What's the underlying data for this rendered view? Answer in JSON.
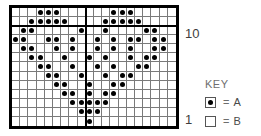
{
  "chart_data": {
    "type": "heatmap",
    "title": "",
    "subtitle": "",
    "xlabel": "",
    "ylabel": "",
    "grid": true,
    "legend_position": "right",
    "columns": 20,
    "rows": 13,
    "symbols": {
      "A": "filled-dot",
      "B": "empty"
    },
    "row_labels": {
      "top": "10",
      "bottom": "1"
    },
    "heavy_column_divider_after": 9,
    "heavy_row_divider_after": 2,
    "cells": [
      [
        0,
        0,
        0,
        1,
        1,
        1,
        0,
        0,
        0,
        0,
        0,
        0,
        1,
        1,
        1,
        0,
        0,
        0,
        0,
        0
      ],
      [
        0,
        0,
        1,
        1,
        1,
        1,
        1,
        0,
        0,
        0,
        0,
        1,
        1,
        1,
        1,
        1,
        0,
        0,
        0,
        0
      ],
      [
        0,
        1,
        1,
        0,
        0,
        0,
        0,
        0,
        1,
        0,
        0,
        1,
        0,
        0,
        0,
        0,
        1,
        1,
        0,
        0
      ],
      [
        1,
        1,
        0,
        0,
        1,
        1,
        0,
        1,
        0,
        0,
        1,
        0,
        1,
        0,
        1,
        1,
        0,
        1,
        1,
        0
      ],
      [
        0,
        1,
        1,
        0,
        0,
        1,
        0,
        1,
        0,
        0,
        1,
        0,
        1,
        0,
        1,
        0,
        0,
        1,
        1,
        0
      ],
      [
        0,
        0,
        1,
        1,
        0,
        0,
        1,
        0,
        0,
        1,
        0,
        1,
        0,
        0,
        1,
        0,
        1,
        1,
        0,
        0
      ],
      [
        0,
        0,
        0,
        1,
        1,
        0,
        0,
        1,
        0,
        0,
        1,
        0,
        1,
        0,
        0,
        1,
        1,
        0,
        0,
        0
      ],
      [
        0,
        0,
        0,
        0,
        1,
        1,
        0,
        0,
        1,
        0,
        0,
        1,
        0,
        1,
        1,
        0,
        0,
        0,
        0,
        0
      ],
      [
        0,
        0,
        0,
        0,
        0,
        1,
        1,
        0,
        0,
        1,
        0,
        0,
        1,
        1,
        0,
        0,
        0,
        0,
        0,
        0
      ],
      [
        0,
        0,
        0,
        0,
        0,
        0,
        1,
        1,
        0,
        1,
        0,
        1,
        1,
        0,
        0,
        0,
        0,
        0,
        0,
        0
      ],
      [
        0,
        0,
        0,
        0,
        0,
        0,
        0,
        1,
        1,
        1,
        1,
        1,
        0,
        0,
        0,
        0,
        0,
        0,
        0,
        0
      ],
      [
        0,
        0,
        0,
        0,
        0,
        0,
        0,
        0,
        1,
        1,
        1,
        0,
        0,
        0,
        0,
        0,
        0,
        0,
        0,
        0
      ],
      [
        0,
        0,
        0,
        0,
        0,
        0,
        0,
        0,
        0,
        1,
        0,
        0,
        0,
        0,
        0,
        0,
        0,
        0,
        0,
        0
      ]
    ]
  },
  "key": {
    "title": "KEY",
    "entries": [
      {
        "symbol": "filled-dot",
        "equals": "=",
        "label": "A"
      },
      {
        "symbol": "empty",
        "equals": "=",
        "label": "B"
      }
    ]
  },
  "colors": {
    "grid_line": "#7a7a7a",
    "border": "#000000",
    "dot": "#000000",
    "label_text": "#3d3d3d",
    "key_text": "#6e6e6e",
    "background": "#ffffff"
  }
}
